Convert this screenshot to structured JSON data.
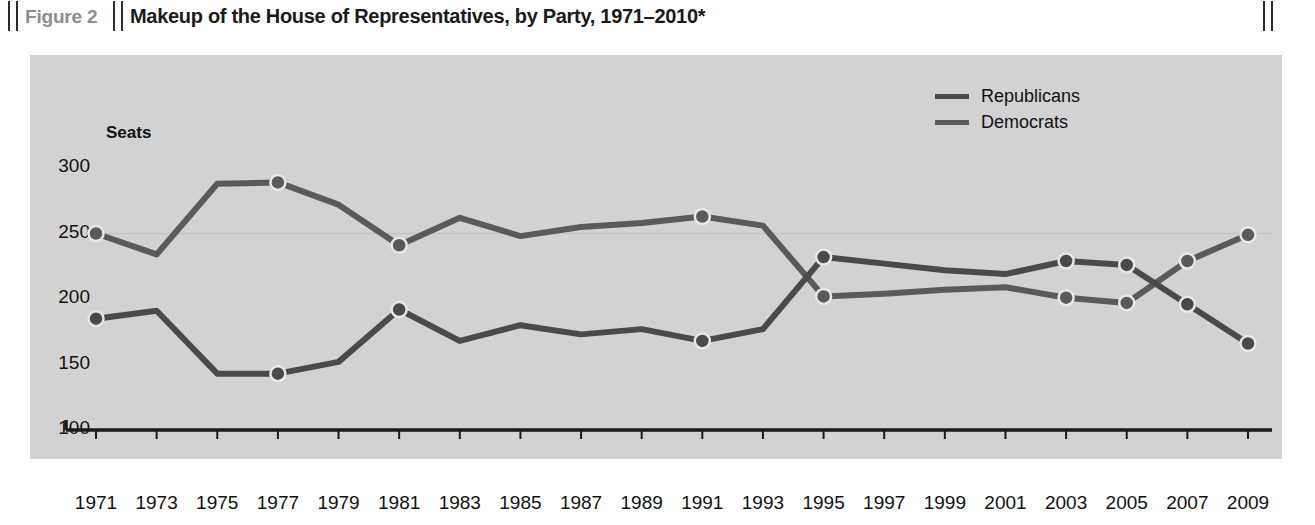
{
  "figure": {
    "label": "Figure 2",
    "title": "Makeup of the House of Representatives, by Party, 1971–2010*"
  },
  "legend": {
    "position": "top-right",
    "entries": [
      {
        "label": "Republicans",
        "color": "#4a4a4a"
      },
      {
        "label": "Democrats",
        "color": "#5a5a5a"
      }
    ]
  },
  "axis": {
    "y_title": "Seats",
    "y_ticks": [
      "100",
      "150",
      "200",
      "250",
      "300"
    ],
    "x_ticks": [
      "1971",
      "1973",
      "1975",
      "1977",
      "1979",
      "1981",
      "1983",
      "1985",
      "1987",
      "1989",
      "1991",
      "1993",
      "1995",
      "1997",
      "1999",
      "2001",
      "2003",
      "2005",
      "2007",
      "2009"
    ]
  },
  "colors": {
    "panel_background": "#d2d2d2",
    "republican_line": "#4a4a4a",
    "democrat_line": "#5a5a5a",
    "axis": "#1a1a1a",
    "figure_label": "#8d8d8d"
  },
  "chart_data": {
    "type": "line",
    "title": "Makeup of the House of Representatives, by Party, 1971–2010*",
    "xlabel": "",
    "ylabel": "Seats",
    "ylim": [
      100,
      300
    ],
    "grid": false,
    "legend_position": "top-right",
    "x": [
      1971,
      1973,
      1975,
      1977,
      1979,
      1981,
      1983,
      1985,
      1987,
      1989,
      1991,
      1993,
      1995,
      1997,
      1999,
      2001,
      2003,
      2005,
      2007,
      2009
    ],
    "series": [
      {
        "name": "Democrats",
        "color": "#5a5a5a",
        "values": [
          250,
          234,
          288,
          289,
          272,
          241,
          262,
          248,
          255,
          258,
          263,
          256,
          202,
          204,
          207,
          209,
          201,
          197,
          229,
          249
        ],
        "markers_at": [
          1971,
          1977,
          1981,
          1991,
          1995,
          2003,
          2005,
          2007,
          2009
        ]
      },
      {
        "name": "Republicans",
        "color": "#4a4a4a",
        "values": [
          185,
          191,
          143,
          143,
          152,
          192,
          168,
          180,
          173,
          177,
          168,
          177,
          232,
          227,
          222,
          219,
          229,
          226,
          196,
          166
        ],
        "markers_at": [
          1971,
          1977,
          1981,
          1991,
          1995,
          2003,
          2005,
          2007,
          2009
        ]
      }
    ]
  }
}
